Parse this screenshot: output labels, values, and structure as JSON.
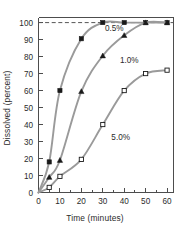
{
  "chart_data": {
    "type": "line",
    "title": "",
    "xlabel": "Time (minutes)",
    "ylabel": "Dissolved (percent)",
    "xlim": [
      0,
      63
    ],
    "ylim": [
      0,
      103
    ],
    "xticks": [
      0,
      10,
      20,
      30,
      40,
      50,
      60
    ],
    "xtick_labels": [
      "0",
      "10",
      "20",
      "30",
      "40",
      "50",
      "60"
    ],
    "xminor_step": 5,
    "yticks": [
      0,
      10,
      20,
      30,
      40,
      50,
      60,
      70,
      80,
      90,
      100
    ],
    "ytick_labels": [
      "0",
      "10",
      "20",
      "30",
      "40",
      "50",
      "60",
      "70",
      "80",
      "90",
      "100"
    ],
    "grid": false,
    "legend_position": "inline-annotations",
    "reference_lines": [
      {
        "name": "complete-dissolution-line",
        "orientation": "horizontal",
        "value": 100,
        "style": "dashed",
        "color": "#555555"
      }
    ],
    "line_color": "#9a9a9a",
    "series": [
      {
        "name": "0.5%",
        "label": "0.5%",
        "marker": "filled-square",
        "marker_color": "#1a1a1a",
        "x": [
          0,
          5,
          10,
          20,
          30,
          40,
          50,
          60
        ],
        "values": [
          0,
          18,
          60,
          90.5,
          100,
          100,
          100,
          100
        ]
      },
      {
        "name": "1.0%",
        "label": "1.0%",
        "marker": "filled-triangle",
        "marker_color": "#1a1a1a",
        "x": [
          0,
          5,
          10,
          20,
          30,
          40,
          50,
          60
        ],
        "values": [
          0,
          9,
          19,
          59.5,
          80.5,
          92.5,
          100,
          100
        ]
      },
      {
        "name": "5.0%",
        "label": "5.0%",
        "marker": "open-square",
        "marker_color": "#1a1a1a",
        "x": [
          0,
          5,
          10,
          20,
          30,
          40,
          50,
          60
        ],
        "values": [
          0,
          3,
          9.5,
          19.5,
          40,
          60,
          70,
          72
        ]
      }
    ],
    "annotations": [
      {
        "text": "0.5%",
        "x": 31,
        "y": 95,
        "name": "series-label-0-5"
      },
      {
        "text": "1.0%",
        "x": 38,
        "y": 76,
        "name": "series-label-1-0"
      },
      {
        "text": "5.0%",
        "x": 34,
        "y": 31,
        "name": "series-label-5-0"
      }
    ]
  }
}
